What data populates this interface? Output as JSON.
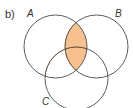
{
  "part_label": "b)",
  "sets": [
    {
      "name": "A",
      "cx": 55.5,
      "cy": 46.5,
      "r": 31.5
    },
    {
      "name": "B",
      "cx": 96.5,
      "cy": 46.5,
      "r": 31.5
    },
    {
      "name": "C",
      "cx": 76.5,
      "cy": 78.5,
      "r": 31.5
    }
  ],
  "shaded_region": "A ∩ B",
  "colors": {
    "outline": "#4a4a4a",
    "shade_fill": "#f7c08f",
    "shade_stroke": "#e8924a",
    "text": "#333333"
  }
}
